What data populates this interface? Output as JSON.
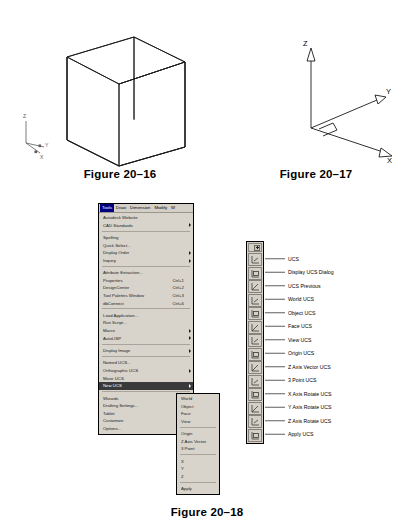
{
  "figures": {
    "fig_2016": {
      "caption": "Figure 20–16",
      "ucs_icon_labels": [
        "Z",
        "Y",
        "X"
      ],
      "description": "isometric wireframe cube with UCS icon"
    },
    "fig_2017": {
      "caption": "Figure 20–17",
      "axis_labels": [
        "Z",
        "Y",
        "X"
      ],
      "description": "3D coordinate axes with arrowheads and right angle marker"
    },
    "fig_2018": {
      "caption": "Figure 20–18",
      "description": "AutoCAD Tools menu with New UCS submenu and UCS toolbar"
    }
  },
  "menubar": {
    "items": [
      {
        "label": "Tools",
        "active": true
      },
      {
        "label": "Draw",
        "active": false
      },
      {
        "label": "Dimension",
        "active": false
      },
      {
        "label": "Modify",
        "active": false
      },
      {
        "label": "W",
        "active": false
      }
    ]
  },
  "tools_menu": {
    "groups": [
      {
        "items": [
          {
            "label": "Autodesk Website",
            "accel": "",
            "submenu": false,
            "selected": false
          },
          {
            "label": "CAD Standards",
            "accel": "",
            "submenu": true,
            "selected": false
          }
        ]
      },
      {
        "items": [
          {
            "label": "Spelling",
            "accel": "",
            "submenu": false,
            "selected": false
          },
          {
            "label": "Quick Select...",
            "accel": "",
            "submenu": false,
            "selected": false
          },
          {
            "label": "Display Order",
            "accel": "",
            "submenu": true,
            "selected": false
          },
          {
            "label": "Inquiry",
            "accel": "",
            "submenu": true,
            "selected": false
          }
        ]
      },
      {
        "items": [
          {
            "label": "Attribute Extraction...",
            "accel": "",
            "submenu": false,
            "selected": false
          },
          {
            "label": "Properties",
            "accel": "Ctrl+1",
            "submenu": false,
            "selected": false
          },
          {
            "label": "DesignCenter",
            "accel": "Ctrl+2",
            "submenu": false,
            "selected": false
          },
          {
            "label": "Tool Palettes Window",
            "accel": "Ctrl+3",
            "submenu": false,
            "selected": false
          },
          {
            "label": "dbConnect",
            "accel": "Ctrl+6",
            "submenu": false,
            "selected": false
          }
        ]
      },
      {
        "items": [
          {
            "label": "Load Application...",
            "accel": "",
            "submenu": false,
            "selected": false
          },
          {
            "label": "Run Script...",
            "accel": "",
            "submenu": false,
            "selected": false
          },
          {
            "label": "Macro",
            "accel": "",
            "submenu": true,
            "selected": false
          },
          {
            "label": "AutoLISP",
            "accel": "",
            "submenu": true,
            "selected": false
          }
        ]
      },
      {
        "items": [
          {
            "label": "Display Image",
            "accel": "",
            "submenu": true,
            "selected": false
          }
        ]
      },
      {
        "items": [
          {
            "label": "Named UCS...",
            "accel": "",
            "submenu": false,
            "selected": false
          },
          {
            "label": "Orthographic UCS",
            "accel": "",
            "submenu": true,
            "selected": false
          },
          {
            "label": "Move UCS",
            "accel": "",
            "submenu": false,
            "selected": false
          },
          {
            "label": "New UCS",
            "accel": "",
            "submenu": true,
            "selected": true
          }
        ]
      },
      {
        "items": [
          {
            "label": "Wizards",
            "accel": "",
            "submenu": true,
            "selected": false
          },
          {
            "label": "Drafting Settings...",
            "accel": "",
            "submenu": false,
            "selected": false
          },
          {
            "label": "Tablet",
            "accel": "",
            "submenu": true,
            "selected": false
          },
          {
            "label": "Customize",
            "accel": "",
            "submenu": true,
            "selected": false
          },
          {
            "label": "Options...",
            "accel": "",
            "submenu": false,
            "selected": false
          }
        ]
      }
    ]
  },
  "new_ucs_submenu": {
    "groups": [
      {
        "items": [
          {
            "label": "World"
          },
          {
            "label": "Object"
          },
          {
            "label": "Face"
          },
          {
            "label": "View"
          }
        ]
      },
      {
        "items": [
          {
            "label": "Origin"
          },
          {
            "label": "Z Axis Vector"
          },
          {
            "label": "3 Point"
          }
        ]
      },
      {
        "items": [
          {
            "label": "X"
          },
          {
            "label": "Y"
          },
          {
            "label": "Z"
          }
        ]
      },
      {
        "items": [
          {
            "label": "Apply"
          }
        ]
      }
    ]
  },
  "ucs_toolbar": {
    "title_close_icon": "close-icon",
    "buttons": [
      {
        "icon": "ucs-icon",
        "label": "UCS"
      },
      {
        "icon": "display-ucs-dialog-icon",
        "label": "Display UCS Dialog"
      },
      {
        "icon": "ucs-previous-icon",
        "label": "UCS Previous"
      },
      {
        "icon": "world-ucs-icon",
        "label": "World UCS"
      },
      {
        "icon": "object-ucs-icon",
        "label": "Object UCS"
      },
      {
        "icon": "face-ucs-icon",
        "label": "Face UCS"
      },
      {
        "icon": "view-ucs-icon",
        "label": "View UCS"
      },
      {
        "icon": "origin-ucs-icon",
        "label": "Origin UCS"
      },
      {
        "icon": "z-axis-vector-ucs-icon",
        "label": "Z Axis Vector UCS"
      },
      {
        "icon": "3-point-ucs-icon",
        "label": "3 Point UCS"
      },
      {
        "icon": "x-axis-rotate-ucs-icon",
        "label": "X Axis Rotate UCS"
      },
      {
        "icon": "y-axis-rotate-ucs-icon",
        "label": "Y Axis Rotate UCS"
      },
      {
        "icon": "z-axis-rotate-ucs-icon",
        "label": "Z Axis Rotate UCS"
      },
      {
        "icon": "apply-ucs-icon",
        "label": "Apply UCS"
      }
    ]
  },
  "colors": {
    "menu_face": "#d8d4cc",
    "menu_border": "#000000",
    "selection": "#3a3a3a",
    "menubar_active": "#000080",
    "line": "#000000"
  }
}
